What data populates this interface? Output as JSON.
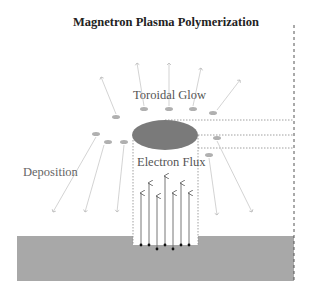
{
  "diagram": {
    "title": "Magnetron Plasma Polymerization",
    "labels": {
      "toroidal_glow": "Toroidal Glow",
      "electron_flux": "Electron Flux",
      "deposition": "Deposition"
    },
    "colors": {
      "substrate": "#a8a8a8",
      "glow_ellipse": "#7a7a7a",
      "particles": "#b0b0b0",
      "deposition_arrows": "#c8c8c8",
      "electron_arrows": "#666666",
      "electrons": "#111111",
      "dashed_lines": "#888888"
    },
    "electron_arrow_count": 7,
    "deposition_arrow_count": 10
  }
}
